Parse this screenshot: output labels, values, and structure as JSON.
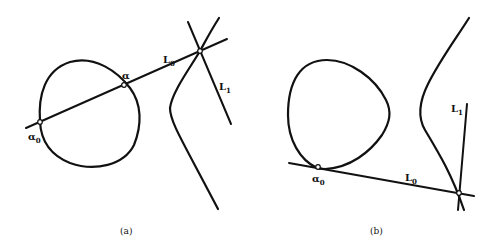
{
  "panels": [
    {
      "caption": "(a)",
      "labels": {
        "alpha0": {
          "base": "α",
          "sub": "0"
        },
        "alpha": {
          "base": "α",
          "sub": ""
        },
        "L0": {
          "base": "L",
          "sub": "0"
        },
        "L1": {
          "base": "L",
          "sub": "1"
        }
      }
    },
    {
      "caption": "(b)",
      "labels": {
        "alpha0": {
          "base": "α",
          "sub": "0"
        },
        "L0": {
          "base": "L",
          "sub": "0"
        },
        "L1": {
          "base": "L",
          "sub": "1"
        }
      }
    }
  ],
  "colors": {
    "stroke": "#111111",
    "background": "#ffffff"
  }
}
